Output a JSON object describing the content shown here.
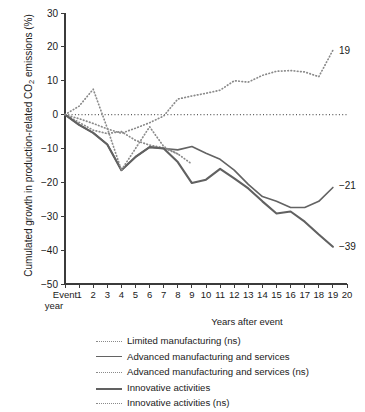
{
  "chart_data": {
    "type": "line",
    "title": "",
    "xlabel": "Years after event",
    "ylabel": "Cumulated growth in production-related CO2 emissions (%)",
    "ylabel_prefix": "Cumulated growth in production-related CO",
    "ylabel_sub": "2",
    "ylabel_suffix": " emissions (%)",
    "xlim": [
      0,
      20
    ],
    "ylim": [
      -50,
      30
    ],
    "grid": false,
    "zero_reference_line": true,
    "origin_tick_label": "Event year",
    "origin_tick_label_line1": "Event",
    "origin_tick_label_line2": "year",
    "x": [
      0,
      1,
      2,
      3,
      4,
      5,
      6,
      7,
      8,
      9,
      10,
      11,
      12,
      13,
      14,
      15,
      16,
      17,
      18,
      19,
      20
    ],
    "xticks": [
      "1",
      "2",
      "3",
      "4",
      "5",
      "6",
      "7",
      "8",
      "9",
      "10",
      "11",
      "12",
      "13",
      "14",
      "15",
      "16",
      "17",
      "18",
      "19",
      "20"
    ],
    "yticks": [
      30,
      20,
      10,
      0,
      -10,
      -20,
      -30,
      -40,
      -50
    ],
    "ytick_labels": [
      "30",
      "20",
      "10",
      "0",
      "−10",
      "−20",
      "−30",
      "−40",
      "−50"
    ],
    "legend_position": "below",
    "series": [
      {
        "name": "Limited manufacturing (ns)",
        "style": "dotted",
        "color": "#8a8a8a",
        "end_label": "19",
        "x": [
          0,
          1,
          2,
          3,
          4,
          5,
          6,
          7,
          8,
          9,
          10,
          11,
          12,
          13,
          14,
          15,
          16,
          17,
          18,
          19
        ],
        "values": [
          0,
          -1.2,
          -2.6,
          -4.2,
          -5.5,
          -4.0,
          -2.4,
          -0.4,
          4.6,
          5.5,
          6.3,
          7.2,
          10.0,
          9.6,
          11.6,
          12.8,
          13.0,
          12.6,
          11.2,
          19.0
        ]
      },
      {
        "name": "Advanced manufacturing and services",
        "style": "solid-thin",
        "color": "#636363",
        "end_label": "−21",
        "x": [
          0,
          1,
          2,
          3,
          4,
          5,
          6,
          7,
          8,
          9,
          10,
          11,
          12,
          13,
          14,
          15,
          16,
          17,
          18,
          19
        ],
        "values": [
          0,
          -3.0,
          -5.4,
          -8.8,
          -16.4,
          -12.5,
          -9.6,
          -10.0,
          -10.4,
          -9.4,
          -11.4,
          -13.2,
          -16.4,
          -20.6,
          -24.2,
          -25.6,
          -27.4,
          -27.4,
          -25.6,
          -21.5
        ]
      },
      {
        "name": "Advanced manufacturing and services (ns)",
        "style": "dotted",
        "color": "#8a8a8a",
        "end_label": "",
        "x": [
          0,
          1,
          2,
          3,
          4,
          5,
          6,
          7,
          8
        ],
        "values": [
          0,
          -2.3,
          -4.6,
          -5.6,
          -5.0,
          -7.6,
          -9.0,
          -9.8,
          -11.6
        ]
      },
      {
        "name": "Innovative activities",
        "style": "solid-thick",
        "color": "#616161",
        "end_label": "−39",
        "x": [
          0,
          1,
          2,
          3,
          4,
          5,
          6,
          7,
          8,
          9,
          10,
          11,
          12,
          13,
          14,
          15,
          16,
          17,
          18,
          19
        ],
        "values": [
          0,
          -3.0,
          -5.4,
          -8.8,
          -16.4,
          -12.5,
          -9.6,
          -10.0,
          -14.0,
          -20.2,
          -19.2,
          -16.0,
          -18.8,
          -21.8,
          -25.6,
          -29.2,
          -28.6,
          -31.6,
          -35.4,
          -39.0
        ]
      },
      {
        "name": "Innovative activities (ns)",
        "style": "dotted",
        "color": "#8a8a8a",
        "end_label": "",
        "x": [
          0,
          1,
          2,
          3,
          4,
          5,
          6,
          7,
          8,
          9
        ],
        "values": [
          0,
          2.5,
          7.5,
          -4.0,
          -16.4,
          -10.0,
          -3.6,
          -9.4,
          -11.6,
          -14.6
        ]
      }
    ],
    "annotations": [
      {
        "text": "19",
        "x": 19,
        "y": 19
      },
      {
        "text": "−21",
        "x": 19,
        "y": -21
      },
      {
        "text": "−39",
        "x": 19,
        "y": -39
      }
    ]
  },
  "legend": {
    "items": [
      {
        "label": "Limited manufacturing (ns)",
        "style": "dotted"
      },
      {
        "label": "Advanced manufacturing and services",
        "style": "solid-thin"
      },
      {
        "label": "Advanced manufacturing and services (ns)",
        "style": "dotted"
      },
      {
        "label": "Innovative activities",
        "style": "solid-thick"
      },
      {
        "label": "Innovative activities (ns)",
        "style": "dotted"
      }
    ]
  }
}
